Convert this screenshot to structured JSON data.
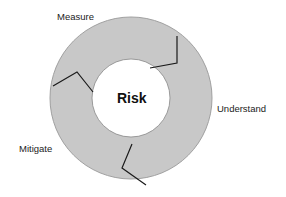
{
  "diagram": {
    "center": "Risk",
    "stages": [
      {
        "label": "Measure"
      },
      {
        "label": "Understand"
      },
      {
        "label": "Mitigate"
      }
    ],
    "colors": {
      "ring_fill": "#c8c8c8",
      "ring_stroke": "#9a9a9a",
      "divider": "#1a1a1a",
      "center_fill": "#ffffff"
    }
  }
}
